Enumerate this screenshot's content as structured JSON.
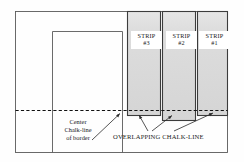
{
  "figure": {
    "type": "technical-diagram",
    "title_visible": false,
    "background_color": "#fefefe",
    "line_color": "#4a4a4a",
    "dash_color": "#1a1a1a",
    "strip_fill": "#d9d9d9",
    "strip_fill_top": "#e8e8e8",
    "label_box_fill": "#ffffff"
  },
  "strips": [
    {
      "name": "strip-3",
      "line1": "STRIP",
      "line2": "#3"
    },
    {
      "name": "strip-2",
      "line1": "STRIP",
      "line2": "#2"
    },
    {
      "name": "strip-1",
      "line1": "STRIP",
      "line2": "#1"
    }
  ],
  "annotations": {
    "center_chalk_line": {
      "line1": "Center",
      "line2": "Chalk-line",
      "line3": "of border"
    },
    "overlapping_chalk_line": {
      "text": "OVERLAPPING CHALK-LINE"
    }
  }
}
